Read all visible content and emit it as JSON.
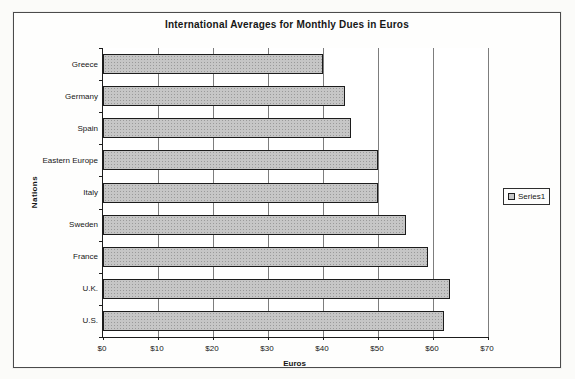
{
  "colors": {
    "bar_fill": "#c6c6c6",
    "bar_border": "#1c1c1c",
    "gridline": "#7d7d7d",
    "frame_border": "#4b4b4b",
    "background": "#fbfbf9"
  },
  "chart_data": {
    "type": "bar",
    "orientation": "horizontal",
    "title": "International Averages for Monthly Dues in Euros",
    "xlabel": "Euros",
    "ylabel": "Nations",
    "categories": [
      "Greece",
      "Germany",
      "Spain",
      "Eastern Europe",
      "Italy",
      "Sweden",
      "France",
      "U.K.",
      "U.S."
    ],
    "values": [
      40,
      44,
      45,
      50,
      50,
      55,
      59,
      63,
      62
    ],
    "xlim": [
      0,
      70
    ],
    "xtick_labels": [
      "$0",
      "$10",
      "$20",
      "$30",
      "$40",
      "$50",
      "$60",
      "$70"
    ],
    "grid": true,
    "legend": {
      "position": "right",
      "entries": [
        {
          "label": "Series1",
          "color": "#c6c6c6"
        }
      ]
    }
  }
}
